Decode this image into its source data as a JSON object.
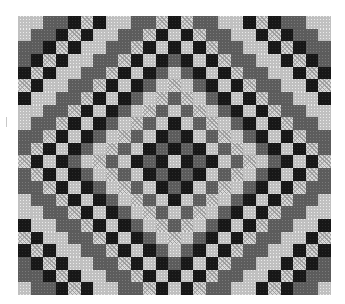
{
  "image": {
    "subject": "Quilt with concentric diamond checkerboard pattern",
    "palette": {
      "dark": "#1c1c1c",
      "mid": "#5e5e5e",
      "light": "#bdbdbd",
      "pattern": "#d6d6d6",
      "background": "#ffffff"
    }
  },
  "quilt": {
    "left": 18,
    "top": 16,
    "width": 313,
    "height": 279,
    "cols": 25,
    "rows": 22,
    "center_col": 12,
    "center_row": 11,
    "ring_tones": [
      "dark",
      "pattern",
      "mid",
      "light"
    ]
  }
}
